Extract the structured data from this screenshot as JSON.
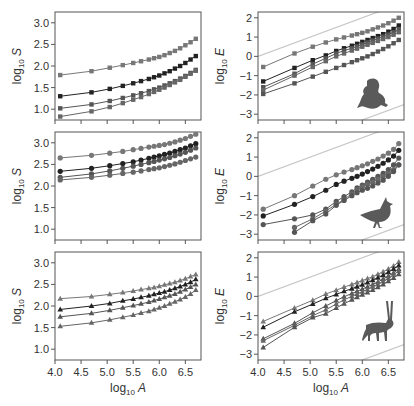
{
  "axes_labels": {
    "x": "log10 A",
    "y_left": "log10 S",
    "y_right": "log10 E"
  },
  "chart_data": [
    {
      "id": "amphibian-S",
      "type": "line",
      "title": "",
      "taxon": "amphibians",
      "marker": "square",
      "xlabel": "log10 A",
      "ylabel": "log10 S",
      "xlim": [
        4.0,
        6.8
      ],
      "ylim": [
        0.75,
        3.25
      ],
      "xticks": [
        "4.0",
        "4.5",
        "5.0",
        "5.5",
        "6.0",
        "6.5"
      ],
      "yticks": [
        "1.0",
        "1.5",
        "2.0",
        "2.5",
        "3.0"
      ],
      "x": [
        4.1,
        4.7,
        5.05,
        5.3,
        5.5,
        5.65,
        5.8,
        5.9,
        6.0,
        6.1,
        6.2,
        6.3,
        6.4,
        6.5,
        6.6,
        6.7
      ],
      "series": [
        {
          "name": "series-1",
          "color": "#777777",
          "values": [
            1.79,
            1.88,
            1.96,
            2.02,
            2.07,
            2.11,
            2.15,
            2.18,
            2.21,
            2.25,
            2.3,
            2.35,
            2.41,
            2.48,
            2.55,
            2.63
          ]
        },
        {
          "name": "series-2",
          "color": "#222222",
          "values": [
            1.3,
            1.39,
            1.47,
            1.54,
            1.6,
            1.65,
            1.7,
            1.74,
            1.78,
            1.83,
            1.88,
            1.94,
            2.0,
            2.07,
            2.15,
            2.23
          ]
        },
        {
          "name": "series-3",
          "color": "#555555",
          "values": [
            1.02,
            1.11,
            1.19,
            1.26,
            1.32,
            1.37,
            1.42,
            1.46,
            1.5,
            1.55,
            1.6,
            1.65,
            1.71,
            1.77,
            1.84,
            1.91
          ]
        },
        {
          "name": "series-4",
          "color": "#666666",
          "values": [
            0.83,
            0.95,
            1.05,
            1.14,
            1.22,
            1.28,
            1.35,
            1.4,
            1.45,
            1.5,
            1.56,
            1.62,
            1.68,
            1.75,
            1.82,
            1.89
          ]
        }
      ]
    },
    {
      "id": "amphibian-E",
      "type": "line",
      "title": "",
      "taxon": "amphibians",
      "marker": "square",
      "icon": "frog-silhouette",
      "xlabel": "log10 A",
      "ylabel": "log10 E",
      "xlim": [
        4.0,
        6.8
      ],
      "ylim": [
        -3.3,
        2.3
      ],
      "xticks": [
        "4.0",
        "4.5",
        "5.0",
        "5.5",
        "6.0",
        "6.5"
      ],
      "yticks": [
        "-3",
        "-2",
        "-1",
        "0",
        "1",
        "2"
      ],
      "reference_lines": [
        {
          "intercept_at_4": 0.0,
          "slope": 1.0
        },
        {
          "intercept_at_4": -5.3,
          "slope": 1.0
        }
      ],
      "x": [
        4.1,
        4.7,
        5.05,
        5.3,
        5.5,
        5.65,
        5.8,
        5.9,
        6.0,
        6.1,
        6.2,
        6.3,
        6.4,
        6.5,
        6.6,
        6.7
      ],
      "series": [
        {
          "name": "series-1",
          "color": "#777777",
          "values": [
            -0.55,
            0.15,
            0.5,
            0.72,
            0.88,
            0.98,
            1.08,
            1.15,
            1.22,
            1.3,
            1.4,
            1.5,
            1.6,
            1.72,
            1.85,
            2.0
          ]
        },
        {
          "name": "series-2",
          "color": "#222222",
          "values": [
            -1.3,
            -0.6,
            -0.2,
            0.05,
            0.28,
            0.42,
            0.55,
            0.65,
            0.75,
            0.85,
            0.95,
            1.05,
            1.15,
            1.28,
            1.42,
            1.6
          ]
        },
        {
          "name": "series-3",
          "color": "#555555",
          "values": [
            -1.6,
            -0.9,
            -0.4,
            -0.1,
            0.15,
            0.3,
            0.42,
            0.52,
            0.62,
            0.72,
            0.82,
            0.92,
            1.02,
            1.13,
            1.25,
            1.38
          ]
        },
        {
          "name": "series-4",
          "color": "#666666",
          "values": [
            -1.75,
            -1.0,
            -0.55,
            -0.25,
            0.0,
            0.15,
            0.3,
            0.4,
            0.5,
            0.6,
            0.7,
            0.8,
            0.9,
            1.0,
            1.12,
            1.25
          ]
        },
        {
          "name": "series-5",
          "color": "#555555",
          "values": [
            -1.95,
            -1.4,
            -1.05,
            -0.8,
            -0.6,
            -0.45,
            -0.3,
            -0.2,
            -0.1,
            0.0,
            0.12,
            0.25,
            0.38,
            0.52,
            0.68,
            0.85
          ]
        }
      ]
    },
    {
      "id": "bird-S",
      "type": "line",
      "title": "",
      "taxon": "birds",
      "marker": "circle",
      "xlabel": "log10 A",
      "ylabel": "log10 S",
      "xlim": [
        4.0,
        6.8
      ],
      "ylim": [
        0.75,
        3.25
      ],
      "xticks": [
        "4.0",
        "4.5",
        "5.0",
        "5.5",
        "6.0",
        "6.5"
      ],
      "yticks": [
        "1.0",
        "1.5",
        "2.0",
        "2.5",
        "3.0"
      ],
      "x": [
        4.1,
        4.7,
        5.05,
        5.3,
        5.5,
        5.65,
        5.8,
        5.9,
        6.0,
        6.1,
        6.2,
        6.3,
        6.4,
        6.5,
        6.6,
        6.7
      ],
      "series": [
        {
          "name": "series-1",
          "color": "#777777",
          "values": [
            2.65,
            2.71,
            2.76,
            2.8,
            2.84,
            2.87,
            2.9,
            2.92,
            2.94,
            2.96,
            2.99,
            3.02,
            3.06,
            3.1,
            3.15,
            3.2
          ]
        },
        {
          "name": "series-2",
          "color": "#222222",
          "values": [
            2.34,
            2.41,
            2.47,
            2.52,
            2.56,
            2.6,
            2.64,
            2.67,
            2.7,
            2.73,
            2.76,
            2.8,
            2.84,
            2.88,
            2.93,
            2.98
          ]
        },
        {
          "name": "series-3",
          "color": "#555555",
          "values": [
            2.2,
            2.28,
            2.35,
            2.41,
            2.46,
            2.5,
            2.54,
            2.57,
            2.6,
            2.63,
            2.66,
            2.7,
            2.74,
            2.78,
            2.83,
            2.88
          ]
        },
        {
          "name": "series-4",
          "color": "#666666",
          "values": [
            2.14,
            2.2,
            2.25,
            2.29,
            2.32,
            2.35,
            2.38,
            2.4,
            2.42,
            2.45,
            2.48,
            2.51,
            2.55,
            2.59,
            2.63,
            2.67
          ]
        }
      ]
    },
    {
      "id": "bird-E",
      "type": "line",
      "title": "",
      "taxon": "birds",
      "marker": "circle",
      "icon": "bird-silhouette",
      "xlabel": "log10 A",
      "ylabel": "log10 E",
      "xlim": [
        4.0,
        6.8
      ],
      "ylim": [
        -3.3,
        2.3
      ],
      "xticks": [
        "4.0",
        "4.5",
        "5.0",
        "5.5",
        "6.0",
        "6.5"
      ],
      "yticks": [
        "-3",
        "-2",
        "-1",
        "0",
        "1",
        "2"
      ],
      "reference_lines": [
        {
          "intercept_at_4": 0.0,
          "slope": 1.0
        },
        {
          "intercept_at_4": -5.3,
          "slope": 1.0
        }
      ],
      "x": [
        4.1,
        4.7,
        5.05,
        5.3,
        5.5,
        5.65,
        5.8,
        5.9,
        6.0,
        6.1,
        6.2,
        6.3,
        6.4,
        6.5,
        6.6,
        6.7
      ],
      "series": [
        {
          "name": "series-1",
          "color": "#777777",
          "values": [
            -1.7,
            -1.0,
            -0.5,
            -0.15,
            0.08,
            0.22,
            0.35,
            0.45,
            0.55,
            0.65,
            0.78,
            0.9,
            1.05,
            1.2,
            1.4,
            1.7
          ]
        },
        {
          "name": "series-2",
          "color": "#222222",
          "values": [
            -2.05,
            -1.45,
            -1.05,
            -0.72,
            -0.42,
            -0.25,
            -0.1,
            0.0,
            0.12,
            0.25,
            0.38,
            0.52,
            0.68,
            0.85,
            1.05,
            1.35
          ]
        },
        {
          "name": "series-3",
          "color": "#555555",
          "values": [
            -2.5,
            -2.2,
            -2.0,
            -1.7,
            -1.3,
            -1.05,
            -0.8,
            -0.6,
            -0.45,
            -0.3,
            -0.15,
            0.0,
            0.15,
            0.35,
            0.6,
            0.95
          ]
        },
        {
          "name": "series-4",
          "color": "#666666",
          "values": [
            null,
            -2.65,
            -2.2,
            -1.8,
            -1.45,
            -1.2,
            -0.9,
            -0.7,
            -0.55,
            -0.42,
            -0.3,
            -0.15,
            0.0,
            0.15,
            0.35,
            0.6
          ]
        },
        {
          "name": "series-5",
          "color": "#555555",
          "values": [
            null,
            -2.9,
            -2.3,
            -1.95,
            -1.5,
            -1.25,
            -1.0,
            -0.85,
            -0.72,
            -0.62,
            -0.5,
            -0.35,
            -0.2,
            0.0,
            0.25,
            0.6
          ]
        }
      ]
    },
    {
      "id": "mammal-S",
      "type": "line",
      "title": "",
      "taxon": "mammals",
      "marker": "triangle",
      "xlabel": "log10 A",
      "ylabel": "log10 S",
      "xlim": [
        4.0,
        6.8
      ],
      "ylim": [
        0.75,
        3.25
      ],
      "xticks": [
        "4.0",
        "4.5",
        "5.0",
        "5.5",
        "6.0",
        "6.5"
      ],
      "yticks": [
        "1.0",
        "1.5",
        "2.0",
        "2.5",
        "3.0"
      ],
      "x": [
        4.1,
        4.7,
        5.05,
        5.3,
        5.5,
        5.65,
        5.8,
        5.9,
        6.0,
        6.1,
        6.2,
        6.3,
        6.4,
        6.5,
        6.6,
        6.7
      ],
      "series": [
        {
          "name": "series-1",
          "color": "#777777",
          "values": [
            2.17,
            2.22,
            2.27,
            2.31,
            2.35,
            2.38,
            2.41,
            2.43,
            2.46,
            2.49,
            2.52,
            2.55,
            2.59,
            2.63,
            2.68,
            2.73
          ]
        },
        {
          "name": "series-2",
          "color": "#222222",
          "values": [
            1.92,
            2.0,
            2.06,
            2.12,
            2.16,
            2.2,
            2.24,
            2.27,
            2.3,
            2.33,
            2.37,
            2.41,
            2.45,
            2.5,
            2.55,
            2.62
          ]
        },
        {
          "name": "series-3",
          "color": "#555555",
          "values": [
            1.75,
            1.83,
            1.9,
            1.96,
            2.01,
            2.05,
            2.09,
            2.13,
            2.16,
            2.2,
            2.24,
            2.28,
            2.33,
            2.38,
            2.44,
            2.5
          ]
        },
        {
          "name": "series-4",
          "color": "#666666",
          "values": [
            1.53,
            1.61,
            1.68,
            1.74,
            1.79,
            1.84,
            1.88,
            1.92,
            1.96,
            2.0,
            2.05,
            2.1,
            2.15,
            2.21,
            2.28,
            2.37
          ]
        }
      ]
    },
    {
      "id": "mammal-E",
      "type": "line",
      "title": "",
      "taxon": "mammals",
      "marker": "triangle",
      "icon": "oryx-silhouette",
      "xlabel": "log10 A",
      "ylabel": "log10 E",
      "xlim": [
        4.0,
        6.8
      ],
      "ylim": [
        -3.3,
        2.3
      ],
      "xticks": [
        "4.0",
        "4.5",
        "5.0",
        "5.5",
        "6.0",
        "6.5"
      ],
      "yticks": [
        "-3",
        "-2",
        "-1",
        "0",
        "1",
        "2"
      ],
      "reference_lines": [
        {
          "intercept_at_4": 0.0,
          "slope": 1.0
        },
        {
          "intercept_at_4": -5.3,
          "slope": 1.0
        }
      ],
      "x": [
        4.1,
        4.7,
        5.05,
        5.3,
        5.5,
        5.65,
        5.8,
        5.9,
        6.0,
        6.1,
        6.2,
        6.3,
        6.4,
        6.5,
        6.6,
        6.7
      ],
      "series": [
        {
          "name": "series-1",
          "color": "#777777",
          "values": [
            -1.3,
            -0.6,
            -0.2,
            0.12,
            0.32,
            0.48,
            0.62,
            0.72,
            0.82,
            0.92,
            1.02,
            1.15,
            1.28,
            1.42,
            1.58,
            1.78
          ]
        },
        {
          "name": "series-2",
          "color": "#222222",
          "values": [
            -1.6,
            -0.8,
            -0.4,
            -0.1,
            0.1,
            0.26,
            0.4,
            0.5,
            0.6,
            0.72,
            0.84,
            0.97,
            1.1,
            1.25,
            1.42,
            1.6
          ]
        },
        {
          "name": "series-3",
          "color": "#555555",
          "values": [
            -2.2,
            -1.4,
            -0.85,
            -0.5,
            -0.22,
            -0.02,
            0.15,
            0.26,
            0.38,
            0.5,
            0.62,
            0.75,
            0.9,
            1.05,
            1.22,
            1.42
          ]
        },
        {
          "name": "series-4",
          "color": "#666666",
          "values": [
            -2.3,
            -1.5,
            -1.0,
            -0.7,
            -0.4,
            -0.18,
            0.0,
            0.12,
            0.24,
            0.36,
            0.5,
            0.63,
            0.78,
            0.94,
            1.12,
            1.32
          ]
        },
        {
          "name": "series-5",
          "color": "#555555",
          "values": [
            -2.65,
            -1.6,
            -1.1,
            -0.9,
            -0.6,
            -0.38,
            -0.18,
            -0.05,
            0.08,
            0.2,
            0.33,
            0.47,
            0.62,
            0.78,
            0.95,
            1.15
          ]
        }
      ]
    }
  ]
}
